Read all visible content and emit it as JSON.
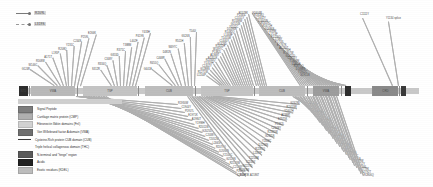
{
  "figure": {
    "type": "protein-domain-mutation-map",
    "title": ""
  },
  "line_legend": {
    "items": [
      {
        "label": "R209L",
        "style": "solid"
      },
      {
        "label": "L319S",
        "style": "dashed"
      }
    ]
  },
  "protein_bar": {
    "length_aa": 2813,
    "segments": [
      {
        "name": "NTD",
        "label": "NTD",
        "start_pct": 0.0,
        "width_pct": 2.2,
        "color": "#2e2e2e"
      },
      {
        "name": "VWA1",
        "label": "VWA",
        "start_pct": 3.0,
        "width_pct": 11.0,
        "color": "#b9b9b9"
      },
      {
        "name": "TSP1",
        "label": "TSP",
        "start_pct": 16.0,
        "width_pct": 13.5,
        "color": "#c4c4c4"
      },
      {
        "name": "CUB1",
        "label": "CUB",
        "start_pct": 31.5,
        "width_pct": 12.0,
        "color": "#bdbdbd"
      },
      {
        "name": "TSP2",
        "label": "TSP",
        "start_pct": 45.5,
        "width_pct": 13.0,
        "color": "#c4c4c4"
      },
      {
        "name": "CUB2",
        "label": "CUB",
        "start_pct": 60.0,
        "width_pct": 11.5,
        "color": "#bdbdbd"
      },
      {
        "name": "VWA2",
        "label": "VWA",
        "start_pct": 73.5,
        "width_pct": 6.5,
        "color": "#9d9d9d"
      },
      {
        "name": "CTD",
        "label": "",
        "start_pct": 81.5,
        "width_pct": 1.6,
        "color": "#2e2e2e"
      },
      {
        "name": "CRD",
        "label": "CRD",
        "start_pct": 88.5,
        "width_pct": 6.2,
        "color": "#8a8a8a"
      },
      {
        "name": "END",
        "label": "",
        "start_pct": 95.4,
        "width_pct": 1.4,
        "color": "#3a3a3a"
      }
    ],
    "ticks_pct": [
      2.4,
      14.6,
      29.8,
      44.0,
      58.8,
      72.0,
      80.4,
      88.2,
      94.9
    ],
    "right_annotations": [
      "C1111Y",
      "Y1134 splice"
    ]
  },
  "block_legend": {
    "items": [
      {
        "label": "Signal Peptide",
        "color": "#7d7d7d",
        "kind": "block"
      },
      {
        "label": "Cartilage matrix protein (CMP)",
        "color": "#b0b0b0",
        "kind": "block"
      },
      {
        "label": "Fibronectin Illdiiin domains (FnI)",
        "color": "#d2d2d2",
        "kind": "block"
      },
      {
        "label": "Von Willebrand factor A domain (VWA)",
        "color": "#6f6f6f",
        "kind": "block"
      },
      {
        "label": "Cysteine-Rich protein CUB domain (CUB)",
        "color": "#3c3c3c",
        "kind": "line"
      },
      {
        "label": "Triple helical collagenous domain (THC)",
        "color": "transparent",
        "kind": "none"
      },
      {
        "label": "N-terminal and \"hinge\" region",
        "color": "#5a5a5a",
        "kind": "block"
      },
      {
        "label": "Acidic",
        "color": "#222222",
        "kind": "block"
      },
      {
        "label": "Exotic   residues (KDEL)",
        "color": "#bdbdbd",
        "kind": "block"
      }
    ]
  },
  "clusters": {
    "top_left": {
      "anchor_pct": 12.0,
      "mutations": [
        "G124R",
        "W146C",
        "R168W",
        "A171T",
        "L195P",
        "R208Q",
        "Y231C",
        "C244S",
        "P259L",
        "E266K"
      ]
    },
    "top_mid_left": {
      "anchor_pct": 26.0,
      "mutations": [
        "S312R",
        "R334Q",
        "C348Y",
        "G355D",
        "R371C",
        "T388M",
        "L402F",
        "P419S",
        "Y433H"
      ]
    },
    "top_mid": {
      "anchor_pct": 41.0,
      "mutations": [
        "G441E",
        "R455Q",
        "C468R",
        "D481N",
        "W497C",
        "R511H",
        "G526S",
        "T540I"
      ]
    },
    "top_right_a": {
      "anchor_pct": 56.0,
      "mutations": [
        "L1244P",
        "R1271W",
        "G1288S",
        "C1302Y",
        "Y1319H",
        "R1334Q",
        "E1351K",
        "A1368T",
        "P1382L",
        "W1397C",
        "R1411H",
        "G1426D",
        "C1440Y",
        "T1455M",
        "L1468F",
        "R1482Q",
        "D1496N",
        "Y1511C",
        "G1524S",
        "R1538W",
        "C1551Y",
        "P1565L",
        "E1578K"
      ]
    },
    "top_right_b": {
      "anchor_pct": 76.0,
      "mutations": [
        "G1604R",
        "R1618Q",
        "C1632Y",
        "D1645N",
        "W1659C",
        "R1672H",
        "G1686S",
        "T1699M",
        "L1713F",
        "R1726Q",
        "C1740Y",
        "P1753L",
        "E1767K",
        "A1780T",
        "Y1794H",
        "R1807W",
        "G1821D",
        "C1834Y",
        "T1848M",
        "L1861F",
        "R1875Q",
        "D1888N",
        "Y1902C",
        "G1915S"
      ]
    },
    "bottom_left": {
      "anchor_pct": 18.0,
      "mutations": [
        "R1930W",
        "C1944Y",
        "P1957L",
        "E1971K",
        "A1984T",
        "Y1998H",
        "R2011W",
        "G2025D",
        "C2038Y",
        "T2052M",
        "L2065F",
        "R2079Q",
        "D2092N",
        "Y2106C",
        "G2119S",
        "R2133W",
        "C2146Y",
        "P2160L",
        "E2173K   A2186T"
      ]
    },
    "bottom_mid": {
      "anchor_pct": 46.0,
      "mutations": [
        "Y2200H",
        "R2213W",
        "G2227D",
        "C2240Y",
        "T2254M",
        "L2267F",
        "R2281Q",
        "D2294N",
        "Y2308C",
        "G2321S",
        "R2335W",
        "C2348Y",
        "P2362L",
        "E2375K",
        "A2388T",
        "Y2402H",
        "R2415W",
        "G2429D"
      ]
    },
    "bottom_right": {
      "anchor_pct": 74.0,
      "mutations": [
        "C2442Y",
        "T2456M",
        "L2469F",
        "R2483Q",
        "D2496N",
        "Y2510C",
        "G2523S",
        "R2537W",
        "C2550Y",
        "P2564L",
        "E2577K",
        "A2590T",
        "Y2604H",
        "R2617W",
        "G2631D",
        "C2644Y",
        "T2658M",
        "L2671F",
        "R2685Q",
        "D2698N",
        "Y2712C",
        "G2725S",
        "R2739W",
        "C2752Y",
        "P2766L",
        "E2779K",
        "A2792T",
        "R2806Q"
      ]
    }
  }
}
